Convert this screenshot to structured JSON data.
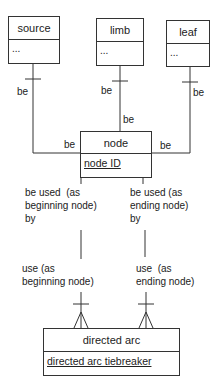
{
  "entities": {
    "source": {
      "name": "source",
      "attribute": "..."
    },
    "limb": {
      "name": "limb",
      "attribute": "..."
    },
    "leaf": {
      "name": "leaf",
      "attribute": "..."
    },
    "node": {
      "name": "node",
      "attribute": "node ID"
    },
    "directed_arc": {
      "name": "directed arc",
      "attribute": "directed arc tiebreaker"
    }
  },
  "relationships": {
    "source_node": {
      "parent_label": "be",
      "child_label": "be"
    },
    "limb_node": {
      "parent_label": "be",
      "child_label": "be"
    },
    "leaf_node": {
      "parent_label": "be",
      "child_label": "be"
    },
    "node_arc_beginning": {
      "node_side_label": "be used  (as\nbeginning node)\nby",
      "arc_side_label": "use (as\nbeginning node)"
    },
    "node_arc_ending": {
      "node_side_label": "be used (as\nending node)\nby",
      "arc_side_label": "use  (as\nending node)"
    }
  },
  "colors": {
    "line": "#333333",
    "background": "#ffffff",
    "text": "#222222"
  }
}
